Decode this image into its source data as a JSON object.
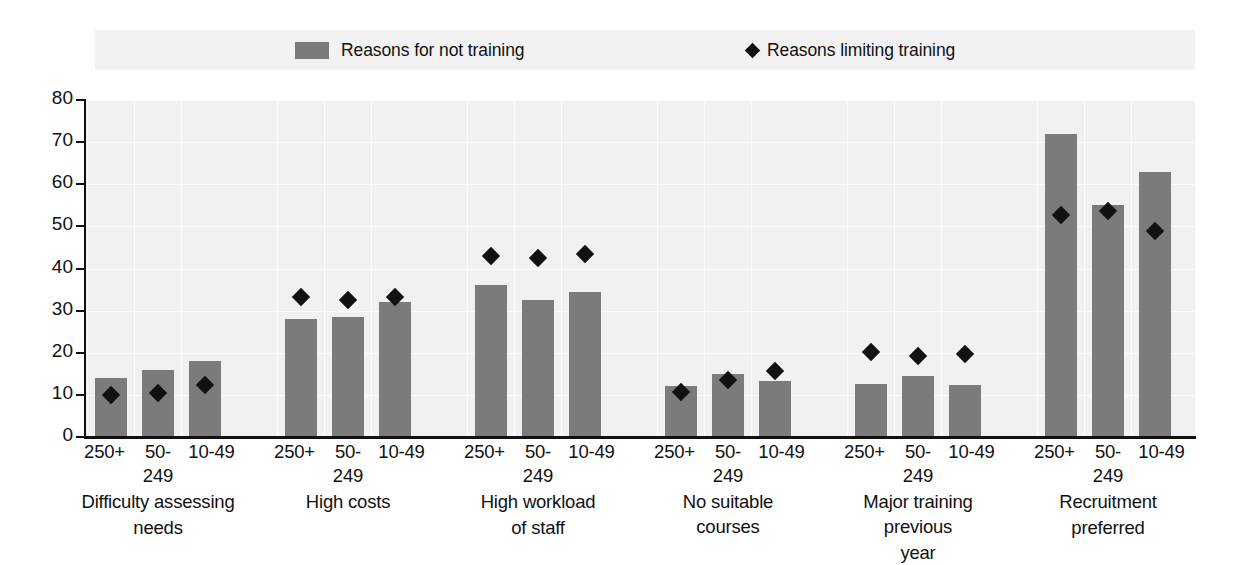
{
  "legend": {
    "bars_label": "Reasons for not training",
    "diamonds_label": "Reasons limiting training",
    "bar_swatch_icon": "filled-square-icon",
    "diamond_swatch_icon": "filled-diamond-icon"
  },
  "axis": {
    "y_ticks": [
      "0",
      "10",
      "20",
      "30",
      "40",
      "50",
      "60",
      "70",
      "80"
    ]
  },
  "chart_data": {
    "type": "bar",
    "title": "",
    "subtitle": "",
    "xlabel": "",
    "ylabel": "",
    "ylim": [
      0,
      80
    ],
    "ytick_step": 10,
    "grid": true,
    "legend_position": "top",
    "bar_color": "#7b7b7b",
    "marker_color": "#111111",
    "group_categories": [
      "Difficulty assessing needs",
      "High costs",
      "High workload of staff",
      "No suitable courses",
      "Major training previous year",
      "Recruitment preferred"
    ],
    "size_classes": [
      "250+",
      "50-249",
      "10-49"
    ],
    "categories": [
      "Difficulty assessing needs 250+",
      "Difficulty assessing needs 50-249",
      "Difficulty assessing needs 10-49",
      "High costs 250+",
      "High costs 50-249",
      "High costs 10-49",
      "High workload of staff 250+",
      "High workload of staff 50-249",
      "High workload of staff 10-49",
      "No suitable courses 250+",
      "No suitable courses 50-249",
      "No suitable courses 10-49",
      "Major training previous year 250+",
      "Major training previous year 50-249",
      "Major training previous year 10-49",
      "Recruitment preferred 250+",
      "Recruitment preferred 50-249",
      "Recruitment preferred 10-49"
    ],
    "series": [
      {
        "name": "Reasons for not training",
        "type": "bar",
        "values": [
          14.0,
          16.0,
          18.0,
          28.0,
          28.5,
          32.0,
          36.0,
          32.5,
          34.5,
          12.0,
          15.0,
          13.2,
          12.5,
          14.5,
          12.3,
          72.0,
          55.0,
          63.0
        ]
      },
      {
        "name": "Reasons limiting training",
        "type": "scatter",
        "marker": "diamond",
        "values": [
          11.5,
          12.0,
          14.0,
          34.8,
          34.0,
          34.8,
          44.5,
          44.0,
          45.0,
          12.3,
          15.0,
          17.3,
          21.7,
          20.7,
          21.2,
          54.3,
          55.2,
          50.5
        ]
      }
    ],
    "groups": [
      {
        "label": "Difficulty assessing needs",
        "label_lines": [
          "Difficulty assessing",
          "needs"
        ],
        "bars": [
          14.0,
          16.0,
          18.0
        ],
        "markers": [
          11.5,
          12.0,
          14.0
        ]
      },
      {
        "label": "High costs",
        "label_lines": [
          "High costs"
        ],
        "bars": [
          28.0,
          28.5,
          32.0
        ],
        "markers": [
          34.8,
          34.0,
          34.8
        ]
      },
      {
        "label": "High workload of staff",
        "label_lines": [
          "High workload",
          "of staff"
        ],
        "bars": [
          36.0,
          32.5,
          34.5
        ],
        "markers": [
          44.5,
          44.0,
          45.0
        ]
      },
      {
        "label": "No suitable courses",
        "label_lines": [
          "No suitable courses"
        ],
        "bars": [
          12.0,
          15.0,
          13.2
        ],
        "markers": [
          12.3,
          15.0,
          17.3
        ]
      },
      {
        "label": "Major training previous year",
        "label_lines": [
          "Major training previous",
          "year"
        ],
        "bars": [
          12.5,
          14.5,
          12.3
        ],
        "markers": [
          21.7,
          20.7,
          21.2
        ]
      },
      {
        "label": "Recruitment preferred",
        "label_lines": [
          "Recruitment",
          "preferred"
        ],
        "bars": [
          72.0,
          55.0,
          63.0
        ],
        "markers": [
          54.3,
          55.2,
          50.5
        ]
      }
    ]
  }
}
